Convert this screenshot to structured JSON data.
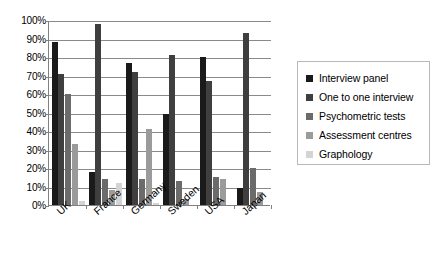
{
  "chart_data": {
    "type": "bar",
    "title": "",
    "subtitle": "",
    "xlabel": "",
    "ylabel": "",
    "ylim": [
      0,
      100
    ],
    "ytick_values": [
      0,
      10,
      20,
      30,
      40,
      50,
      60,
      70,
      80,
      90,
      100
    ],
    "ytick_labels": [
      "0%",
      "10%",
      "20%",
      "30%",
      "40%",
      "50%",
      "60%",
      "70%",
      "80%",
      "90%",
      "100%"
    ],
    "grid": true,
    "grid_axis": "y",
    "legend_position": "right",
    "categories": [
      "UK",
      "France",
      "Germany",
      "Sweden",
      "USA",
      "Japan"
    ],
    "series": [
      {
        "name": "Interview panel",
        "color": "#1a1a1a",
        "values": [
          88,
          18,
          77,
          49,
          80,
          9
        ]
      },
      {
        "name": "One to one interview",
        "color": "#3f3f3f",
        "values": [
          71,
          98,
          72,
          81,
          67,
          93
        ]
      },
      {
        "name": "Psychometric tests",
        "color": "#6b6b6b",
        "values": [
          60,
          14,
          14,
          13,
          15,
          20
        ]
      },
      {
        "name": "Assessment centres",
        "color": "#9b9b9b",
        "values": [
          33,
          8,
          41,
          3,
          14,
          7
        ]
      },
      {
        "name": "Graphology",
        "color": "#d4d4d4",
        "values": [
          2,
          12,
          1,
          0,
          0,
          0
        ]
      }
    ]
  }
}
